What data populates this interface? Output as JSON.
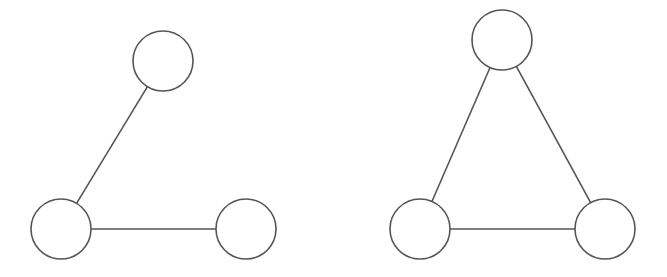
{
  "diagram": {
    "type": "graph-comparison",
    "stroke_color": "#555555",
    "node_fill": "#ffffff",
    "node_radius": 30,
    "graphs": [
      {
        "id": "left",
        "description": "path graph with 3 vertices (2 edges)",
        "nodes": [
          {
            "id": "a",
            "x": 163,
            "y": 61
          },
          {
            "id": "b",
            "x": 61,
            "y": 229
          },
          {
            "id": "c",
            "x": 246,
            "y": 229
          }
        ],
        "edges": [
          [
            "a",
            "b"
          ],
          [
            "b",
            "c"
          ]
        ]
      },
      {
        "id": "right",
        "description": "triangle graph with 3 vertices (3 edges)",
        "nodes": [
          {
            "id": "a",
            "x": 502,
            "y": 40
          },
          {
            "id": "b",
            "x": 420,
            "y": 229
          },
          {
            "id": "c",
            "x": 605,
            "y": 229
          }
        ],
        "edges": [
          [
            "a",
            "b"
          ],
          [
            "a",
            "c"
          ],
          [
            "b",
            "c"
          ]
        ]
      }
    ]
  }
}
